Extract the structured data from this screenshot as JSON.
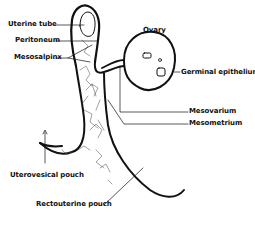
{
  "diagram": {
    "labels": {
      "uterine_tube": "Uterine tube",
      "peritoneum": "Peritoneum",
      "mesosalpinx": "Mesosalpinx",
      "ovary": "Ovary",
      "germinal_epithelium": "Germinal epithelium",
      "mesovarium": "Mesovarium",
      "mesometrium": "Mesometrium",
      "uterovesical_pouch": "Uterovesical pouch",
      "rectouterine_pouch": "Rectouterine pouch"
    },
    "colors": {
      "ink": "#111111",
      "background": "#ffffff"
    }
  }
}
